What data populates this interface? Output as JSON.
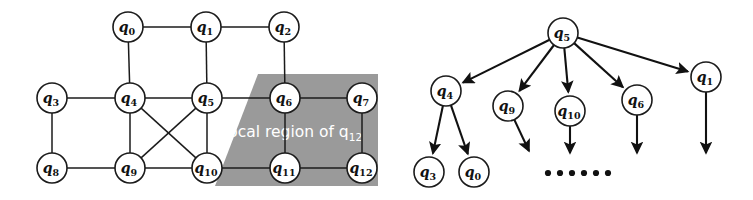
{
  "figure": {
    "background_color": "#ffffff",
    "ink_color": "#111111",
    "region_color": "#9a9a9a",
    "region_text_color": "#ffffff"
  },
  "left_panel": {
    "name": "graph-panel",
    "region": {
      "label_prefix": "local region of q",
      "label_subscript": "12",
      "label_full": "local region of q12"
    },
    "nodes": [
      {
        "id": "q0",
        "base": "q",
        "sub": "0",
        "x": 128,
        "y": 27
      },
      {
        "id": "q1",
        "base": "q",
        "sub": "1",
        "x": 206,
        "y": 27
      },
      {
        "id": "q2",
        "base": "q",
        "sub": "2",
        "x": 284,
        "y": 27
      },
      {
        "id": "q3",
        "base": "q",
        "sub": "3",
        "x": 52,
        "y": 98
      },
      {
        "id": "q4",
        "base": "q",
        "sub": "4",
        "x": 130,
        "y": 98
      },
      {
        "id": "q5",
        "base": "q",
        "sub": "5",
        "x": 207,
        "y": 98
      },
      {
        "id": "q6",
        "base": "q",
        "sub": "6",
        "x": 285,
        "y": 98
      },
      {
        "id": "q7",
        "base": "q",
        "sub": "7",
        "x": 362,
        "y": 98
      },
      {
        "id": "q8",
        "base": "q",
        "sub": "8",
        "x": 52,
        "y": 168
      },
      {
        "id": "q9",
        "base": "q",
        "sub": "9",
        "x": 130,
        "y": 168
      },
      {
        "id": "q10",
        "base": "q",
        "sub": "10",
        "x": 207,
        "y": 168
      },
      {
        "id": "q11",
        "base": "q",
        "sub": "11",
        "x": 285,
        "y": 168
      },
      {
        "id": "q12",
        "base": "q",
        "sub": "12",
        "x": 362,
        "y": 168
      }
    ],
    "edges": [
      [
        "q0",
        "q1"
      ],
      [
        "q1",
        "q2"
      ],
      [
        "q0",
        "q4"
      ],
      [
        "q1",
        "q5"
      ],
      [
        "q2",
        "q6"
      ],
      [
        "q3",
        "q4"
      ],
      [
        "q4",
        "q5"
      ],
      [
        "q5",
        "q6"
      ],
      [
        "q6",
        "q7"
      ],
      [
        "q3",
        "q8"
      ],
      [
        "q4",
        "q9"
      ],
      [
        "q5",
        "q10"
      ],
      [
        "q6",
        "q11"
      ],
      [
        "q7",
        "q12"
      ],
      [
        "q8",
        "q9"
      ],
      [
        "q9",
        "q10"
      ],
      [
        "q10",
        "q11"
      ],
      [
        "q11",
        "q12"
      ],
      [
        "q4",
        "q10"
      ],
      [
        "q5",
        "q9"
      ]
    ]
  },
  "right_panel": {
    "name": "tree-panel",
    "nodes": [
      {
        "id": "t_q5",
        "base": "q",
        "sub": "5",
        "x": 563,
        "y": 33
      },
      {
        "id": "t_q4",
        "base": "q",
        "sub": "4",
        "x": 446,
        "y": 91
      },
      {
        "id": "t_q9",
        "base": "q",
        "sub": "9",
        "x": 508,
        "y": 106
      },
      {
        "id": "t_q10",
        "base": "q",
        "sub": "10",
        "x": 570,
        "y": 111
      },
      {
        "id": "t_q6",
        "base": "q",
        "sub": "6",
        "x": 637,
        "y": 100
      },
      {
        "id": "t_q1",
        "base": "q",
        "sub": "1",
        "x": 706,
        "y": 77
      },
      {
        "id": "t_q3",
        "base": "q",
        "sub": "3",
        "x": 429,
        "y": 172
      },
      {
        "id": "t_q0",
        "base": "q",
        "sub": "0",
        "x": 474,
        "y": 172
      }
    ],
    "edges": [
      [
        "t_q5",
        "t_q4"
      ],
      [
        "t_q5",
        "t_q9"
      ],
      [
        "t_q5",
        "t_q10"
      ],
      [
        "t_q5",
        "t_q6"
      ],
      [
        "t_q5",
        "t_q1"
      ],
      [
        "t_q4",
        "t_q3"
      ],
      [
        "t_q4",
        "t_q0"
      ]
    ],
    "dangling_edges": [
      {
        "from": "t_q9",
        "to_x": 529,
        "to_y": 151
      },
      {
        "from": "t_q10",
        "to_x": 570,
        "to_y": 153
      },
      {
        "from": "t_q6",
        "to_x": 637,
        "to_y": 153
      },
      {
        "from": "t_q1",
        "to_x": 706,
        "to_y": 153
      }
    ],
    "ellipsis": {
      "label": "......",
      "count": 6,
      "y": 173,
      "x_start": 548,
      "spacing": 12
    }
  }
}
